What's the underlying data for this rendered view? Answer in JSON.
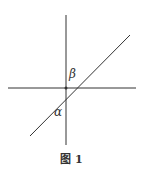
{
  "figure": {
    "caption": "图 1",
    "labels": {
      "beta": "β",
      "alpha": "α"
    },
    "line_color": "#333333"
  }
}
